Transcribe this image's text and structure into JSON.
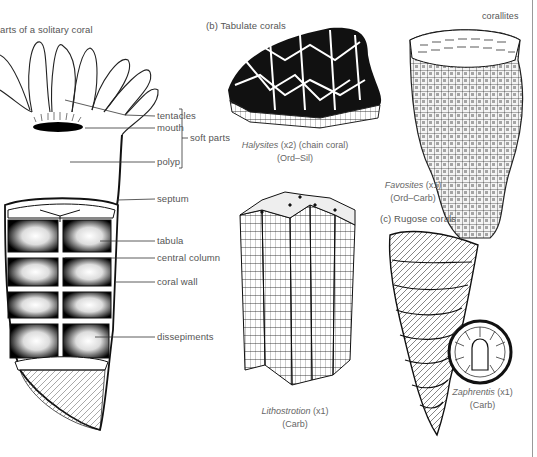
{
  "panel_a": {
    "title": "arts of a solitary coral",
    "labels": {
      "tentacles": "tentacles",
      "mouth": "mouth",
      "soft_parts": "soft parts",
      "polyp": "polyp",
      "septum": "septum",
      "tabula": "tabula",
      "central_column": "central column",
      "coral_wall": "coral wall",
      "dissepiments": "dissepiments"
    }
  },
  "panel_b": {
    "title": "(b) Tabulate corals",
    "corallites_label": "corallites",
    "halysites": {
      "name": "Halysites",
      "scale": "(x2)",
      "common": "(chain coral)",
      "age": "(Ord–Sil)"
    },
    "favosites": {
      "name": "Favosites",
      "scale": "(x1)",
      "age": "(Ord–Carb)"
    }
  },
  "panel_c": {
    "title": "(c) Rugose corals",
    "lithostrotion": {
      "name": "Lithostrotion",
      "scale": "(x1)",
      "age": "(Carb)"
    },
    "zaphrentis": {
      "name": "Zaphrentis",
      "scale": "(x1)",
      "age": "(Carb)"
    }
  }
}
